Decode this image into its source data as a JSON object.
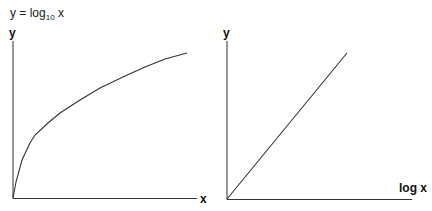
{
  "title": {
    "prefix": "y = log",
    "sub": "10",
    "suffix": " x"
  },
  "chart_data": [
    {
      "type": "line",
      "title": "y = log10 x",
      "xlabel": "x",
      "ylabel": "y",
      "grid": false,
      "description": "Logarithmic curve: steep rise near origin, flattening as x increases",
      "points_px": [
        [
          13,
          198
        ],
        [
          16,
          182
        ],
        [
          22,
          160
        ],
        [
          30,
          143
        ],
        [
          35,
          135
        ],
        [
          48,
          123
        ],
        [
          60,
          113
        ],
        [
          80,
          100
        ],
        [
          100,
          88
        ],
        [
          125,
          76
        ],
        [
          145,
          67
        ],
        [
          165,
          59
        ],
        [
          187,
          53
        ]
      ]
    },
    {
      "type": "line",
      "title": "",
      "xlabel": "log x",
      "ylabel": "y",
      "grid": false,
      "description": "Straight line through origin when plotted against log x",
      "points_px": [
        [
          227,
          199
        ],
        [
          347,
          53
        ]
      ]
    }
  ],
  "left": {
    "ylabel": "y",
    "xlabel": "x"
  },
  "right": {
    "ylabel": "y",
    "xlabel": "log x"
  }
}
